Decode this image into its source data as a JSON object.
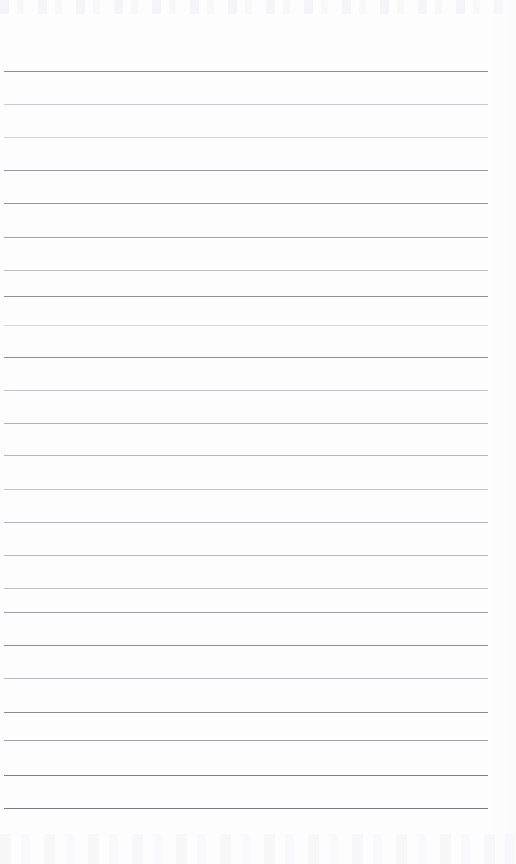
{
  "document": {
    "kind": "scanned-ruled-notebook-paper",
    "page_width": 516,
    "page_height": 864,
    "background_color": "#fdfdfe",
    "written_content": "",
    "header_text": "",
    "footer_text": "",
    "page_number": ""
  },
  "ruling": {
    "line_count": 23,
    "line_left": 4,
    "line_right": 488,
    "line_width": 484,
    "line_thickness": 1,
    "first_line_y": 71,
    "last_line_y": 808,
    "line_spacing": 33.5,
    "top_margin": 71,
    "bottom_margin": 56,
    "left_margin": 4,
    "right_margin": 28,
    "has_vertical_margin_rule": false,
    "ink_color_dark": "#8a8a90",
    "ink_color_mid": "#b4b4ba",
    "ink_color_light": "#d8d8dc",
    "lines": [
      {
        "index": 1,
        "y": 71,
        "color": "#8e8e94",
        "opacity": 1.0
      },
      {
        "index": 2,
        "y": 104,
        "color": "#c9c9cf",
        "opacity": 1.0
      },
      {
        "index": 3,
        "y": 137,
        "color": "#d4d4da",
        "opacity": 1.0
      },
      {
        "index": 4,
        "y": 170,
        "color": "#9a9aa0",
        "opacity": 1.0
      },
      {
        "index": 5,
        "y": 203,
        "color": "#97979d",
        "opacity": 1.0
      },
      {
        "index": 6,
        "y": 237,
        "color": "#a4a4aa",
        "opacity": 1.0
      },
      {
        "index": 7,
        "y": 270,
        "color": "#bdbdc3",
        "opacity": 1.0
      },
      {
        "index": 8,
        "y": 296,
        "color": "#8f8f95",
        "opacity": 1.0
      },
      {
        "index": 9,
        "y": 325,
        "color": "#d6d6dc",
        "opacity": 1.0
      },
      {
        "index": 10,
        "y": 357,
        "color": "#8d8d93",
        "opacity": 1.0
      },
      {
        "index": 11,
        "y": 390,
        "color": "#c2c2c8",
        "opacity": 1.0
      },
      {
        "index": 12,
        "y": 423,
        "color": "#b0b0b6",
        "opacity": 1.0
      },
      {
        "index": 13,
        "y": 455,
        "color": "#b6b6bc",
        "opacity": 1.0
      },
      {
        "index": 14,
        "y": 489,
        "color": "#c4c4ca",
        "opacity": 1.0
      },
      {
        "index": 15,
        "y": 522,
        "color": "#b2b2b8",
        "opacity": 1.0
      },
      {
        "index": 16,
        "y": 555,
        "color": "#bbbbc1",
        "opacity": 1.0
      },
      {
        "index": 17,
        "y": 588,
        "color": "#c0c0c6",
        "opacity": 1.0
      },
      {
        "index": 18,
        "y": 612,
        "color": "#9d9da3",
        "opacity": 1.0
      },
      {
        "index": 19,
        "y": 645,
        "color": "#8c8c92",
        "opacity": 1.0
      },
      {
        "index": 20,
        "y": 678,
        "color": "#b8b8be",
        "opacity": 1.0
      },
      {
        "index": 21,
        "y": 712,
        "color": "#8b8b91",
        "opacity": 1.0
      },
      {
        "index": 22,
        "y": 740,
        "color": "#9f9fa5",
        "opacity": 1.0
      },
      {
        "index": 23,
        "y": 775,
        "color": "#7e7e84",
        "opacity": 1.0
      },
      {
        "index": 24,
        "y": 808,
        "color": "#7a7a80",
        "opacity": 1.0
      }
    ]
  }
}
